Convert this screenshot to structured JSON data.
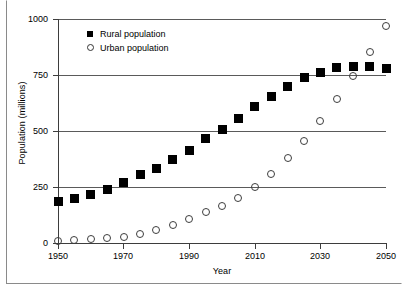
{
  "chart_data": {
    "type": "scatter",
    "title": "",
    "xlabel": "Year",
    "ylabel": "Population (millions)",
    "xlim": [
      1950,
      2050
    ],
    "ylim": [
      0,
      1000
    ],
    "xticks": [
      1950,
      1970,
      1990,
      2010,
      2030,
      2050
    ],
    "yticks": [
      0,
      250,
      500,
      750,
      1000
    ],
    "grid": "horizontal",
    "legend_position": "top-left-inside",
    "x": [
      1950,
      1955,
      1960,
      1965,
      1970,
      1975,
      1980,
      1985,
      1990,
      1995,
      2000,
      2005,
      2010,
      2015,
      2020,
      2025,
      2030,
      2035,
      2040,
      2045,
      2050
    ],
    "series": [
      {
        "name": "Rural population",
        "marker": "filled-square",
        "color": "#000000",
        "values": [
          185,
          197,
          215,
          240,
          272,
          304,
          333,
          372,
          412,
          465,
          508,
          557,
          611,
          656,
          700,
          740,
          763,
          782,
          789,
          788,
          781
        ]
      },
      {
        "name": "Urban population",
        "marker": "open-circle",
        "color": "#3d3d3d",
        "values": [
          10,
          13,
          16,
          22,
          28,
          40,
          56,
          82,
          108,
          138,
          167,
          203,
          251,
          307,
          381,
          456,
          543,
          641,
          747,
          853,
          968
        ]
      }
    ]
  },
  "legend": {
    "items": [
      {
        "label": "Rural population",
        "marker": "filled-square"
      },
      {
        "label": "Urban population",
        "marker": "open-circle"
      }
    ]
  },
  "axes": {
    "y_title": "Population (millions)",
    "x_title": "Year",
    "y_tick_labels": [
      "1000",
      "750",
      "500",
      "250",
      "0"
    ],
    "x_tick_labels": [
      "1950",
      "1970",
      "1990",
      "2010",
      "2030",
      "2050"
    ]
  },
  "colors": {
    "gridline": "#5a5a5a",
    "axis": "#3d3d3d",
    "frame": "#8a8a8a",
    "rural": "#000000",
    "urban": "#3d3d3d"
  }
}
